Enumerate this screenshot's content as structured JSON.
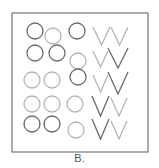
{
  "figure": {
    "caption": "B.",
    "frame": {
      "x": 12,
      "y": 13,
      "width": 136,
      "height": 139,
      "stroke": "#777777"
    },
    "colors": {
      "dark": "#6a6a6a",
      "light": "#b4b4b4"
    },
    "circle_radius": 8,
    "circles": [
      {
        "cx": 35,
        "cy": 31,
        "shade": "dark"
      },
      {
        "cx": 53,
        "cy": 36,
        "shade": "light"
      },
      {
        "cx": 77,
        "cy": 31,
        "shade": "dark"
      },
      {
        "cx": 35,
        "cy": 53,
        "shade": "dark"
      },
      {
        "cx": 57,
        "cy": 53,
        "shade": "dark"
      },
      {
        "cx": 78,
        "cy": 61,
        "shade": "light"
      },
      {
        "cx": 32,
        "cy": 80,
        "shade": "light"
      },
      {
        "cx": 52,
        "cy": 80,
        "shade": "light"
      },
      {
        "cx": 78,
        "cy": 77,
        "shade": "dark"
      },
      {
        "cx": 32,
        "cy": 104,
        "shade": "light"
      },
      {
        "cx": 52,
        "cy": 104,
        "shade": "light"
      },
      {
        "cx": 75,
        "cy": 104,
        "shade": "light"
      },
      {
        "cx": 32,
        "cy": 124,
        "shade": "dark"
      },
      {
        "cx": 52,
        "cy": 124,
        "shade": "dark"
      },
      {
        "cx": 76,
        "cy": 130,
        "shade": "light"
      }
    ],
    "vees": [
      {
        "x": 93,
        "y": 27,
        "w": 17,
        "h": 18,
        "shade": "light"
      },
      {
        "x": 111,
        "y": 27,
        "w": 17,
        "h": 18,
        "shade": "light"
      },
      {
        "x": 93,
        "y": 51,
        "w": 15,
        "h": 16,
        "shade": "light"
      },
      {
        "x": 108,
        "y": 48,
        "w": 20,
        "h": 20,
        "shade": "dark"
      },
      {
        "x": 93,
        "y": 75,
        "w": 15,
        "h": 17,
        "shade": "light"
      },
      {
        "x": 108,
        "y": 72,
        "w": 20,
        "h": 22,
        "shade": "dark"
      },
      {
        "x": 92,
        "y": 96,
        "w": 17,
        "h": 20,
        "shade": "dark"
      },
      {
        "x": 111,
        "y": 98,
        "w": 16,
        "h": 18,
        "shade": "light"
      },
      {
        "x": 92,
        "y": 119,
        "w": 17,
        "h": 20,
        "shade": "dark"
      },
      {
        "x": 111,
        "y": 121,
        "w": 16,
        "h": 18,
        "shade": "light"
      }
    ]
  }
}
